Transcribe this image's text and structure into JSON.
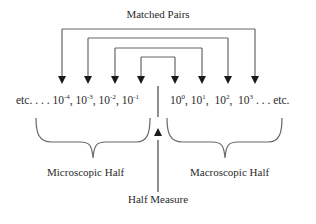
{
  "title": "Matched Pairs",
  "sequence": {
    "left_prefix": "etc. . . .",
    "left_terms": [
      {
        "base": "10",
        "exp": "-4"
      },
      {
        "base": "10",
        "exp": "-3"
      },
      {
        "base": "10",
        "exp": "-2"
      },
      {
        "base": "10",
        "exp": "-1"
      }
    ],
    "right_terms": [
      {
        "base": "10",
        "exp": "0"
      },
      {
        "base": "10",
        "exp": "1"
      },
      {
        "base": "10",
        "exp": "2"
      },
      {
        "base": "10",
        "exp": "3"
      }
    ],
    "right_suffix": ". . . etc."
  },
  "labels": {
    "left_half": "Microscopic Half",
    "right_half": "Macroscopic Half",
    "center": "Half Measure"
  },
  "colors": {
    "line": "#555555",
    "text": "#2a2a2a"
  }
}
